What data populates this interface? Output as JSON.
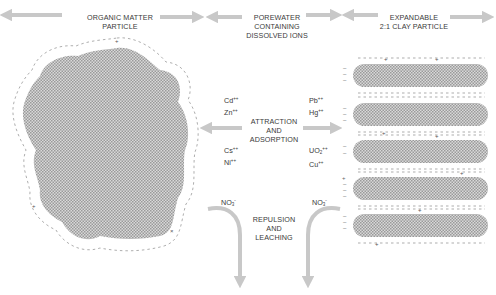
{
  "diagram": {
    "header_fragment": "CONTINUED",
    "particles": {
      "organic": {
        "label_line1": "ORGANIC MATTER",
        "label_line2": "PARTICLE"
      },
      "porewater": {
        "label_line1": "POREWATER",
        "label_line2": "CONTAINING",
        "label_line3": "DISSOLVED IONS"
      },
      "clay": {
        "label_line1": "EXPANDABLE",
        "label_line2": "2:1 CLAY PARTICLE"
      }
    },
    "processes": {
      "attraction": {
        "line1": "ATTRACTION",
        "line2": "AND",
        "line3": "ADSORPTION"
      },
      "repulsion": {
        "line1": "REPULSION",
        "line2": "AND",
        "line3": "LEACHING"
      }
    },
    "ions_left_top": [
      {
        "symbol": "Cd",
        "charge": "++"
      },
      {
        "symbol": "Zn",
        "charge": "++"
      }
    ],
    "ions_left_bottom": [
      {
        "symbol": "Cs",
        "charge": "++"
      },
      {
        "symbol": "Ni",
        "charge": "++"
      }
    ],
    "ions_right_top": [
      {
        "symbol": "Pb",
        "charge": "++"
      },
      {
        "symbol": "Hg",
        "charge": "++"
      }
    ],
    "ions_right_bottom": [
      {
        "symbol": "UO",
        "sub": "2",
        "charge": "++"
      },
      {
        "symbol": "Cu",
        "charge": "++"
      }
    ],
    "anion_left": {
      "symbol": "NO",
      "sub": "3",
      "charge": "-"
    },
    "anion_right": {
      "symbol": "NO",
      "sub": "3",
      "charge": "-"
    },
    "colors": {
      "arrow": "#c8c8c8",
      "particle_fill": "#bdbdbd",
      "text": "#3a3a3a",
      "charge_marks": "#666666"
    }
  }
}
